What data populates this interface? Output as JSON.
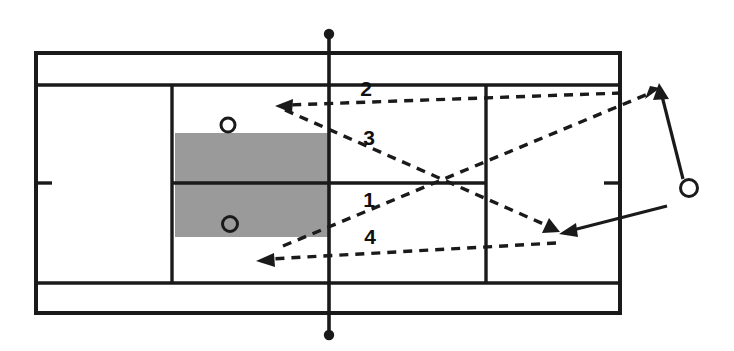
{
  "diagram": {
    "type": "badminton-court-tactics",
    "title": "",
    "colors": {
      "line": "#1a1a1a",
      "shaded_zone": "#9a9a9a",
      "background": "#ffffff"
    },
    "court": {
      "outer": {
        "x": 36,
        "y": 53,
        "width": 584,
        "height": 260
      },
      "top_doubles_long_service_line_y": 85,
      "bottom_doubles_long_service_line_y": 283,
      "center_line_y": 183,
      "left_singles_sideline_x": 172,
      "right_short_service_line_x": 486,
      "net_x": 329,
      "net_top_y": 33,
      "net_bottom_y": 336,
      "left_center_mark": {
        "x1": 36,
        "x2": 52,
        "y": 183
      },
      "right_center_mark": {
        "x1": 604,
        "x2": 620,
        "y": 183
      }
    },
    "shaded_zone": {
      "label": "target-area",
      "x": 175,
      "y": 133,
      "width": 155,
      "height": 104,
      "color": "#9a9a9a"
    },
    "shot_labels": [
      {
        "id": "shot-1",
        "text": "1",
        "x": 369,
        "y": 207
      },
      {
        "id": "shot-2",
        "text": "2",
        "x": 366,
        "y": 96
      },
      {
        "id": "shot-3",
        "text": "3",
        "x": 369,
        "y": 145
      },
      {
        "id": "shot-4",
        "text": "4",
        "x": 370,
        "y": 244
      }
    ],
    "shuttle_paths": [
      {
        "id": "shuttle-path-2",
        "label": "2",
        "from": {
          "x": 621,
          "y": 93
        },
        "to": {
          "x": 277,
          "y": 106
        },
        "style": "dashed",
        "arrow": "end"
      },
      {
        "id": "shuttle-path-3",
        "label": "3",
        "from": {
          "x": 283,
          "y": 110
        },
        "to": {
          "x": 556,
          "y": 230
        },
        "style": "dashed",
        "arrow": "end"
      },
      {
        "id": "shuttle-path-1",
        "label": "1",
        "from": {
          "x": 283,
          "y": 245
        },
        "to": {
          "x": 657,
          "y": 90
        },
        "style": "dashed",
        "arrow": "end"
      },
      {
        "id": "shuttle-path-4",
        "label": "4",
        "from": {
          "x": 556,
          "y": 243
        },
        "to": {
          "x": 258,
          "y": 261
        },
        "style": "dashed",
        "arrow": "end"
      }
    ],
    "player_moves": [
      {
        "id": "player-move-up",
        "from": {
          "x": 682,
          "y": 177
        },
        "to": {
          "x": 660,
          "y": 86
        },
        "style": "solid",
        "arrow": "end"
      },
      {
        "id": "player-move-down-left",
        "from": {
          "x": 666,
          "y": 207
        },
        "to": {
          "x": 560,
          "y": 234
        },
        "style": "solid",
        "arrow": "end"
      }
    ],
    "player_markers": [
      {
        "id": "player-marker-outside",
        "x": 689,
        "y": 188,
        "r": 8.5
      },
      {
        "id": "shuttle-marker-upper",
        "x": 228,
        "y": 125,
        "r": 7
      },
      {
        "id": "shuttle-marker-lower",
        "x": 230,
        "y": 224,
        "r": 7.5
      }
    ]
  }
}
